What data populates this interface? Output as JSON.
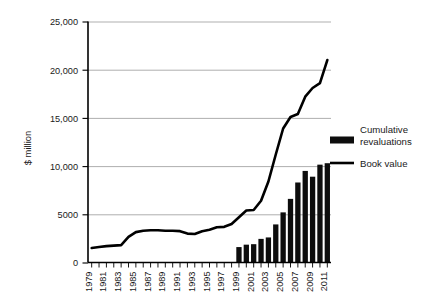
{
  "chart_data": {
    "type": "bar",
    "title": "",
    "xlabel": "",
    "ylabel": "$ million",
    "ylim": [
      0,
      25000
    ],
    "yticks": [
      0,
      5000,
      10000,
      15000,
      20000,
      25000
    ],
    "ytick_labels": [
      "0",
      "5000",
      "10,000",
      "15,000",
      "20,000",
      "25,000"
    ],
    "grid": true,
    "legend_position": "right",
    "x": [
      1979,
      1980,
      1981,
      1982,
      1983,
      1984,
      1985,
      1986,
      1987,
      1988,
      1989,
      1990,
      1991,
      1992,
      1993,
      1994,
      1995,
      1996,
      1997,
      1998,
      1999,
      2000,
      2001,
      2002,
      2003,
      2004,
      2005,
      2006,
      2007,
      2008,
      2009,
      2010,
      2011
    ],
    "xtick_labels": [
      "1979",
      "",
      "1981",
      "",
      "1983",
      "",
      "1985",
      "",
      "1987",
      "",
      "1989",
      "",
      "1991",
      "",
      "1993",
      "",
      "1995",
      "",
      "1997",
      "",
      "1999",
      "",
      "2001",
      "",
      "2003",
      "",
      "2005",
      "",
      "2007",
      "",
      "2009",
      "",
      "2011"
    ],
    "series": [
      {
        "name": "Cumulative revaluations",
        "type": "bar",
        "x": [
          1999,
          2000,
          2001,
          2002,
          2003,
          2004,
          2005,
          2006,
          2007,
          2008,
          2009,
          2010,
          2011
        ],
        "values": [
          1600,
          1850,
          1900,
          2450,
          2600,
          3950,
          5200,
          6600,
          8300,
          9500,
          8900,
          10150,
          10300
        ]
      },
      {
        "name": "Book value",
        "type": "line",
        "x": [
          1979,
          1980,
          1981,
          1982,
          1983,
          1984,
          1985,
          1986,
          1987,
          1988,
          1989,
          1990,
          1991,
          1992,
          1993,
          1994,
          1995,
          1996,
          1997,
          1998,
          1999,
          2000,
          2001,
          2002,
          2003,
          2004,
          2005,
          2006,
          2007,
          2008,
          2009,
          2010,
          2011
        ],
        "values": [
          1500,
          1600,
          1700,
          1750,
          1800,
          2650,
          3150,
          3300,
          3350,
          3350,
          3300,
          3300,
          3250,
          3000,
          2950,
          3250,
          3400,
          3650,
          3700,
          4000,
          4700,
          5400,
          5450,
          6400,
          8400,
          11200,
          13900,
          15100,
          15400,
          17200,
          18100,
          18600,
          21000
        ]
      }
    ],
    "legend": [
      {
        "label_line1": "Cumulative",
        "label_line2": "revaluations",
        "marker": "bar",
        "color": "#0d0d0d"
      },
      {
        "label_line1": "Book value",
        "label_line2": "",
        "marker": "line",
        "color": "#000000"
      }
    ]
  }
}
